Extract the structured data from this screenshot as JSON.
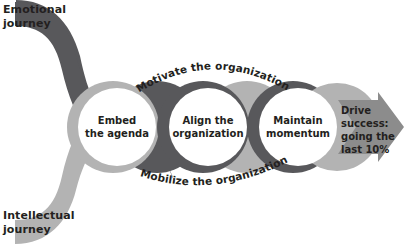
{
  "diagram": {
    "background_color": "#ffffff",
    "colors": {
      "emotional_ribbon": "#58585b",
      "intellectual_ribbon": "#b3b3b3",
      "circle_fill": "#ffffff",
      "arrow": "#8c8c8c",
      "text": "#231f20"
    },
    "journeys": [
      {
        "id": "emotional",
        "label": "Emotional\njourney",
        "color": "#58585b",
        "position": "top-left"
      },
      {
        "id": "intellectual",
        "label": "Intellectual\njourney",
        "color": "#b3b3b3",
        "position": "bottom-left"
      }
    ],
    "stages": [
      {
        "id": "embed",
        "label": "Embed\nthe agenda"
      },
      {
        "id": "align",
        "label": "Align the\norganization"
      },
      {
        "id": "maintain",
        "label": "Maintain\nmomentum"
      }
    ],
    "arc_labels": [
      {
        "id": "motivate",
        "label": "Motivate the organization",
        "position": "top"
      },
      {
        "id": "mobilize",
        "label": "Mobilize the organization",
        "position": "bottom"
      }
    ],
    "outcome": {
      "id": "drive-success",
      "label": "Drive success:\ngoing the\nlast 10%",
      "shape": "right-arrow",
      "color": "#8c8c8c"
    }
  }
}
